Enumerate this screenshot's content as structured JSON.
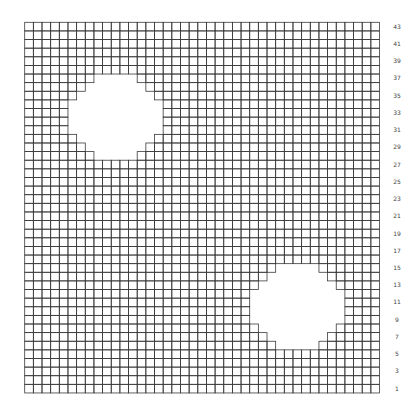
{
  "grid": {
    "columns": 41,
    "rows": 43,
    "origin_x": 24.7,
    "origin_y": 22.3,
    "cell_width": 8.654,
    "cell_height": 8.62,
    "line_color": "#3a3a3a",
    "background": "#ffffff"
  },
  "holes": [
    {
      "name": "upper-left-hole",
      "rows_from_top": [
        {
          "row": 6,
          "from_col": 8,
          "to_col": 12
        },
        {
          "row": 7,
          "from_col": 7,
          "to_col": 13
        },
        {
          "row": 8,
          "from_col": 6,
          "to_col": 14
        },
        {
          "row": 9,
          "from_col": 5,
          "to_col": 15
        },
        {
          "row": 10,
          "from_col": 5,
          "to_col": 15
        },
        {
          "row": 11,
          "from_col": 5,
          "to_col": 15
        },
        {
          "row": 12,
          "from_col": 5,
          "to_col": 15
        },
        {
          "row": 13,
          "from_col": 6,
          "to_col": 14
        },
        {
          "row": 14,
          "from_col": 7,
          "to_col": 13
        },
        {
          "row": 15,
          "from_col": 8,
          "to_col": 12
        }
      ]
    },
    {
      "name": "lower-right-hole",
      "rows_from_top": [
        {
          "row": 28,
          "from_col": 29,
          "to_col": 33
        },
        {
          "row": 29,
          "from_col": 28,
          "to_col": 34
        },
        {
          "row": 30,
          "from_col": 27,
          "to_col": 35
        },
        {
          "row": 31,
          "from_col": 26,
          "to_col": 36
        },
        {
          "row": 32,
          "from_col": 26,
          "to_col": 36
        },
        {
          "row": 33,
          "from_col": 26,
          "to_col": 36
        },
        {
          "row": 34,
          "from_col": 26,
          "to_col": 36
        },
        {
          "row": 35,
          "from_col": 27,
          "to_col": 35
        },
        {
          "row": 36,
          "from_col": 28,
          "to_col": 34
        },
        {
          "row": 37,
          "from_col": 29,
          "to_col": 33
        }
      ]
    }
  ],
  "row_labels": [
    "43",
    "41",
    "39",
    "37",
    "35",
    "33",
    "31",
    "29",
    "27",
    "25",
    "23",
    "21",
    "19",
    "17",
    "15",
    "13",
    "11",
    "9",
    "7",
    "5",
    "3",
    "1"
  ]
}
